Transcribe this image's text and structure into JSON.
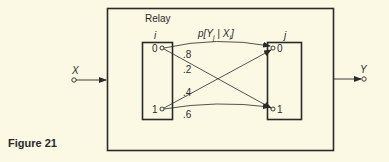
{
  "figure": {
    "caption": "Figure 21",
    "relay_label": "Relay",
    "input_label": "X",
    "output_label": "Y",
    "channel_label": "p[Y",
    "channel_label_sub_j": "j",
    "channel_label_mid": " | X",
    "channel_label_sub_i": "i",
    "channel_label_end": "]",
    "left_box": {
      "index_label": "i",
      "nodes": [
        "0",
        "1"
      ]
    },
    "right_box": {
      "index_label": "j",
      "nodes": [
        "0",
        "1"
      ]
    },
    "transitions": [
      {
        "from": "0",
        "to": "0",
        "prob": ".8"
      },
      {
        "from": "0",
        "to": "1",
        "prob": ".2"
      },
      {
        "from": "1",
        "to": "0",
        "prob": ".4"
      },
      {
        "from": "1",
        "to": "1",
        "prob": ".6"
      }
    ],
    "colors": {
      "background": "#fbf8e4",
      "ink": "#2a2a2a"
    }
  }
}
